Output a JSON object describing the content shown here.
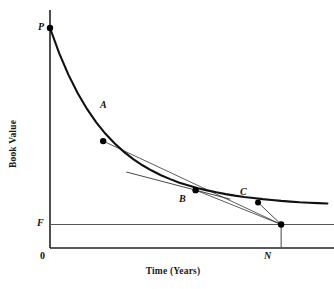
{
  "chart_data": {
    "type": "line",
    "title": "",
    "xlabel": "Time (Years)",
    "ylabel": "Book Value",
    "grid": false,
    "legend": false,
    "axis_origin_label": "0",
    "xlim": [
      0,
      1.22
    ],
    "ylim": [
      0,
      1.09
    ],
    "curve": {
      "name": "book-value-curve",
      "points_x": [
        0.0,
        0.04,
        0.08,
        0.12,
        0.16,
        0.2,
        0.24,
        0.28,
        0.32,
        0.36,
        0.4,
        0.44,
        0.48,
        0.52,
        0.56,
        0.6,
        0.64,
        0.68,
        0.72,
        0.76,
        0.8,
        0.84,
        0.88,
        0.92,
        0.96,
        1.0,
        1.04,
        1.08,
        1.12,
        1.16,
        1.2
      ],
      "points_y": [
        1.0,
        0.885,
        0.787,
        0.703,
        0.632,
        0.571,
        0.519,
        0.475,
        0.437,
        0.404,
        0.376,
        0.352,
        0.331,
        0.313,
        0.297,
        0.284,
        0.272,
        0.262,
        0.253,
        0.245,
        0.238,
        0.232,
        0.227,
        0.222,
        0.218,
        0.214,
        0.211,
        0.208,
        0.206,
        0.204,
        0.202
      ]
    },
    "markers": [
      {
        "label": "P",
        "x": 0.0,
        "y": 1.0,
        "role": "purchase-price"
      },
      {
        "label": "A",
        "x": 0.23,
        "y": 0.486,
        "role": "curve-point"
      },
      {
        "label": "B",
        "x": 0.63,
        "y": 0.263,
        "role": "curve-point"
      },
      {
        "label": "C",
        "x": 0.9,
        "y": 0.207,
        "role": "curve-point"
      },
      {
        "label": "N",
        "x": 1.0,
        "y": 0.107,
        "role": "end-of-life"
      }
    ],
    "reference_lines": [
      {
        "label": "F",
        "type": "horizontal",
        "y": 0.107,
        "role": "salvage-value"
      },
      {
        "label": "N",
        "type": "vertical",
        "x": 1.0,
        "role": "useful-life"
      }
    ],
    "chords": [
      {
        "name": "chord-A-N",
        "from": "A",
        "to": "N"
      },
      {
        "name": "chord-B-N",
        "from": "B",
        "to": "N"
      },
      {
        "name": "chord-C-N",
        "from": "C",
        "to": "N"
      }
    ],
    "tangent": {
      "name": "tangent-at-B",
      "through": "B",
      "x_start": 0.33,
      "x_end": 0.78
    }
  },
  "labels": {
    "P": "P",
    "A": "A",
    "B": "B",
    "C": "C",
    "N": "N",
    "F": "F",
    "origin": "0",
    "xlabel": "Time (Years)",
    "ylabel": "Book Value"
  },
  "colors": {
    "curve": "#111111",
    "axis": "#222222",
    "reference_line": "#4a4a4a",
    "chord": "#333333",
    "marker": "#000000",
    "background": "#ffffff"
  }
}
